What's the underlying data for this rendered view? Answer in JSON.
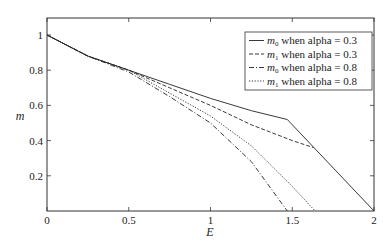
{
  "chart_data": {
    "type": "line",
    "title": "",
    "xlabel": "E",
    "ylabel": "m",
    "xlim": [
      0,
      2
    ],
    "ylim": [
      0,
      1.08
    ],
    "xticks": [
      0,
      0.5,
      1,
      1.5,
      2
    ],
    "xtick_labels": [
      "0",
      "0.5",
      "1",
      "1.5",
      "2"
    ],
    "yticks": [
      0.2,
      0.4,
      0.6,
      0.8,
      1
    ],
    "ytick_labels": [
      "0.2",
      "0.4",
      "0.6",
      "0.8",
      "1"
    ],
    "grid": false,
    "legend_position": "upper right",
    "series": [
      {
        "name": "m0 when alpha = 0.3",
        "sub": "0",
        "alpha_label": "when alpha = 0.3",
        "style": "solid",
        "x": [
          0,
          0.25,
          0.5,
          0.75,
          1.0,
          1.25,
          1.47,
          2.0
        ],
        "y": [
          1.0,
          0.88,
          0.8,
          0.72,
          0.64,
          0.57,
          0.52,
          0.0
        ]
      },
      {
        "name": "m1 when alpha = 0.3",
        "sub": "1",
        "alpha_label": "when alpha = 0.3",
        "style": "dashed",
        "x": [
          0,
          0.25,
          0.5,
          0.75,
          1.0,
          1.25,
          1.5,
          1.63
        ],
        "y": [
          1.0,
          0.88,
          0.8,
          0.7,
          0.6,
          0.49,
          0.4,
          0.36
        ]
      },
      {
        "name": "m0 when alpha = 0.8",
        "sub": "0",
        "alpha_label": "when alpha = 0.8",
        "style": "dashdot",
        "x": [
          0,
          0.25,
          0.5,
          0.75,
          1.0,
          1.25,
          1.47
        ],
        "y": [
          1.0,
          0.88,
          0.79,
          0.65,
          0.5,
          0.28,
          0.0
        ]
      },
      {
        "name": "m1 when alpha = 0.8",
        "sub": "1",
        "alpha_label": "when alpha = 0.8",
        "style": "dotted",
        "x": [
          0,
          0.25,
          0.5,
          0.75,
          1.0,
          1.25,
          1.5,
          1.64
        ],
        "y": [
          1.0,
          0.88,
          0.8,
          0.67,
          0.54,
          0.37,
          0.14,
          0.0
        ]
      }
    ]
  },
  "legend": {
    "m_symbol": "m"
  },
  "colors": {
    "line": "#222222",
    "axis": "#333333"
  }
}
